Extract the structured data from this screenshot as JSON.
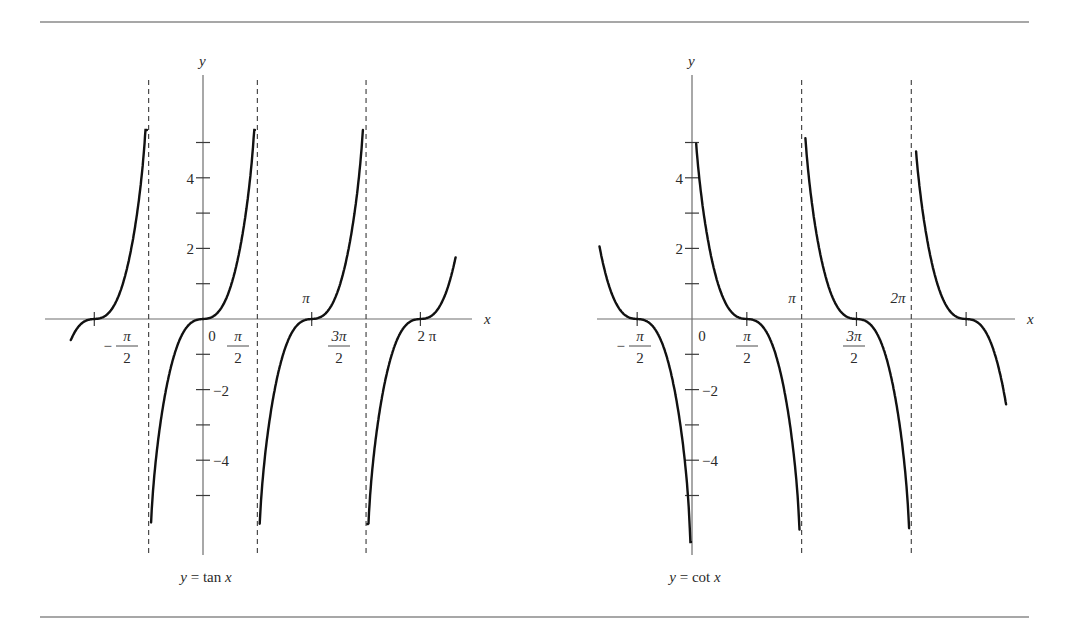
{
  "figure": {
    "rules": {
      "top_y": 22,
      "bottom_y": 617,
      "x1": 40,
      "x2": 1029
    }
  },
  "chart_data": [
    {
      "type": "line",
      "function": "tan",
      "title": "y = tan x",
      "xlabel": "x",
      "ylabel": "y",
      "ylim": [
        -5.5,
        5.5
      ],
      "xlim_radians": [
        -3.9,
        7.55
      ],
      "grid": false,
      "y_ticks": [
        -5,
        -4,
        -3,
        -2,
        -1,
        1,
        2,
        3,
        4,
        5
      ],
      "y_tick_labels": [
        {
          "value": 4,
          "text": "4"
        },
        {
          "value": 2,
          "text": "2"
        },
        {
          "value": -2,
          "text": "−2"
        },
        {
          "value": -4,
          "text": "−4"
        }
      ],
      "x_ticks_radians": [
        -3.1416,
        3.1416,
        6.2832
      ],
      "x_tick_labels": [
        {
          "text": "−π/2",
          "num": "π",
          "den": "2",
          "sign": "−",
          "px": 127,
          "kind": "frac"
        },
        {
          "text": "0",
          "px": 212,
          "kind": "plain"
        },
        {
          "text": "π/2",
          "num": "π",
          "den": "2",
          "px": 238,
          "kind": "frac"
        },
        {
          "text": "π",
          "px": 306,
          "py": 303,
          "kind": "above"
        },
        {
          "text": "3π/2",
          "num": "3π",
          "den": "2",
          "px": 339,
          "kind": "frac"
        },
        {
          "text": "2 π",
          "px": 427,
          "kind": "plain"
        }
      ],
      "asymptotes_radians": [
        -1.5708,
        1.5708,
        4.7124
      ],
      "branches": [
        {
          "x_from": -3.82,
          "x_to": -1.62,
          "zero": -3.1416,
          "period_half": 1.5708
        },
        {
          "x_from": -1.5,
          "x_to": 1.5,
          "zero": 0,
          "period_half": 1.5708
        },
        {
          "x_from": 1.64,
          "x_to": 4.62,
          "zero": 3.1416,
          "period_half": 1.5708
        },
        {
          "x_from": 4.75,
          "x_to": 7.3,
          "zero": 6.2832,
          "period_half": 1.5708
        }
      ],
      "pixel_map": {
        "origin_x": 203,
        "origin_y": 319,
        "px_per_rad": 34.6,
        "px_per_unit": 35.3,
        "axis_x_from": 45,
        "axis_x_to": 472,
        "axis_y_top": 75,
        "axis_y_bottom": 555,
        "asym_top": 80,
        "asym_bottom": 555,
        "clip_top": 130,
        "clip_bottom": 524,
        "x_label_px": 484,
        "y_label_py": 66,
        "caption_px": 206,
        "caption_py": 582
      }
    },
    {
      "type": "line",
      "function": "cot",
      "title": "y = cot x",
      "xlabel": "x",
      "ylabel": "y",
      "ylim": [
        -5.5,
        5.5
      ],
      "xlim_radians": [
        -2.7,
        9.3
      ],
      "grid": false,
      "y_ticks": [
        -5,
        -4,
        -3,
        -2,
        -1,
        1,
        2,
        3,
        4,
        5
      ],
      "y_tick_labels": [
        {
          "value": 4,
          "text": "4"
        },
        {
          "value": 2,
          "text": "2"
        },
        {
          "value": -2,
          "text": "−2"
        },
        {
          "value": -4,
          "text": "−4"
        }
      ],
      "x_ticks_radians": [
        -1.5708,
        1.5708,
        4.7124,
        7.854
      ],
      "x_tick_labels": [
        {
          "text": "−π/2",
          "num": "π",
          "den": "2",
          "sign": "−",
          "px": 640,
          "kind": "frac"
        },
        {
          "text": "0",
          "px": 702,
          "kind": "plain"
        },
        {
          "text": "π/2",
          "num": "π",
          "den": "2",
          "px": 747,
          "kind": "frac"
        },
        {
          "text": "π",
          "px": 792,
          "py": 303,
          "kind": "above"
        },
        {
          "text": "3π/2",
          "num": "3π",
          "den": "2",
          "px": 854,
          "kind": "frac"
        },
        {
          "text": "2π",
          "px": 898,
          "py": 303,
          "kind": "above"
        }
      ],
      "asymptotes_radians": [
        3.1416,
        6.2832
      ],
      "branches": [
        {
          "x_from": -2.65,
          "x_to": -0.03,
          "zero": -1.5708,
          "period_half": 1.5708
        },
        {
          "x_from": 0.12,
          "x_to": 3.08,
          "zero": 1.5708,
          "period_half": 1.5708
        },
        {
          "x_from": 3.25,
          "x_to": 6.22,
          "zero": 4.7124,
          "period_half": 1.5708
        },
        {
          "x_from": 6.42,
          "x_to": 9.0,
          "zero": 7.854,
          "period_half": 1.5708
        }
      ],
      "pixel_map": {
        "origin_x": 692,
        "origin_y": 319,
        "px_per_rad": 34.9,
        "px_per_unit": 35.3,
        "axis_x_from": 597,
        "axis_x_to": 1015,
        "axis_y_top": 75,
        "axis_y_bottom": 555,
        "asym_top": 80,
        "asym_bottom": 555,
        "clip_top": 130,
        "clip_bottom": 542,
        "x_label_px": 1027,
        "y_label_py": 66,
        "caption_px": 695,
        "caption_py": 582
      }
    }
  ]
}
